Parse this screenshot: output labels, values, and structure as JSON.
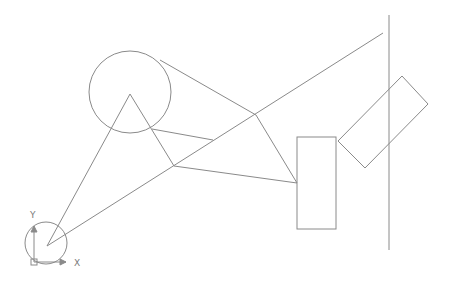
{
  "canvas": {
    "width": 449,
    "height": 283,
    "background": "#ffffff",
    "stroke": "#8a8a8a"
  },
  "ucs": {
    "x_label": "X",
    "y_label": "Y",
    "origin": [
      34,
      262
    ],
    "x_end": [
      66,
      262
    ],
    "y_end": [
      34,
      226
    ],
    "circle": {
      "cx": 46,
      "cy": 243,
      "r": 21
    }
  },
  "shapes": {
    "big_circle": {
      "cx": 130,
      "cy": 92,
      "r": 41
    },
    "triangle_apex": [
      130,
      94
    ],
    "lines": [
      {
        "name": "apex-to-origin",
        "p1": [
          130,
          94
        ],
        "p2": [
          47,
          246
        ]
      },
      {
        "name": "apex-to-vertex-b",
        "p1": [
          130,
          94
        ],
        "p2": [
          174,
          166
        ]
      },
      {
        "name": "tangent-top",
        "p1": [
          160,
          60
        ],
        "p2": [
          256,
          115
        ]
      },
      {
        "name": "circle-to-mid",
        "p1": [
          152,
          129
        ],
        "p2": [
          213,
          140
        ]
      },
      {
        "name": "origin-to-far",
        "p1": [
          47,
          246
        ],
        "p2": [
          383,
          33
        ]
      },
      {
        "name": "vertex-b-to-rect",
        "p1": [
          174,
          166
        ],
        "p2": [
          297,
          183
        ]
      },
      {
        "name": "vertex-c-to-rect",
        "p1": [
          256,
          115
        ],
        "p2": [
          297,
          183
        ]
      }
    ],
    "rectangle": {
      "x": 297,
      "y": 137,
      "width": 39,
      "height": 92
    },
    "rotated_rect": [
      [
        402,
        76
      ],
      [
        428,
        104
      ],
      [
        365,
        168
      ],
      [
        338,
        141
      ]
    ],
    "vertical_line": {
      "x": 389,
      "y1": 15,
      "y2": 250
    }
  }
}
